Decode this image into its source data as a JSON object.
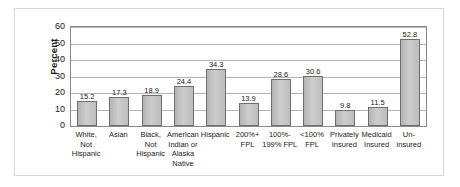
{
  "chart_data": {
    "type": "bar",
    "title": "",
    "xlabel": "",
    "ylabel": "Percent",
    "ylim": [
      0,
      60
    ],
    "yticks": [
      0,
      10,
      20,
      30,
      40,
      50,
      60
    ],
    "grid": true,
    "legend": false,
    "bar_color": "#c0c0c0",
    "bar_border_color": "#6e6e6e",
    "categories": [
      "White,\nNot\nHispanic",
      "Asian",
      "Black,\nNot\nHispanic",
      "American\nIndian or\nAlaska\nNative",
      "Hispanic",
      "200%+\nFPL",
      "100%-\n199% FPL",
      "<100%\nFPL",
      "Privately\nInsured",
      "Medicaid\nInsured",
      "Un-\ninsured"
    ],
    "values": [
      15.2,
      17.3,
      18.9,
      24.4,
      34.3,
      13.9,
      28.6,
      30.6,
      9.8,
      11.5,
      52.8
    ],
    "value_labels": [
      "15.2",
      "17.3",
      "18.9",
      "24.4",
      "34.3",
      "13.9",
      "28.6",
      "30.6",
      "9.8",
      "11.5",
      "52.8"
    ]
  }
}
